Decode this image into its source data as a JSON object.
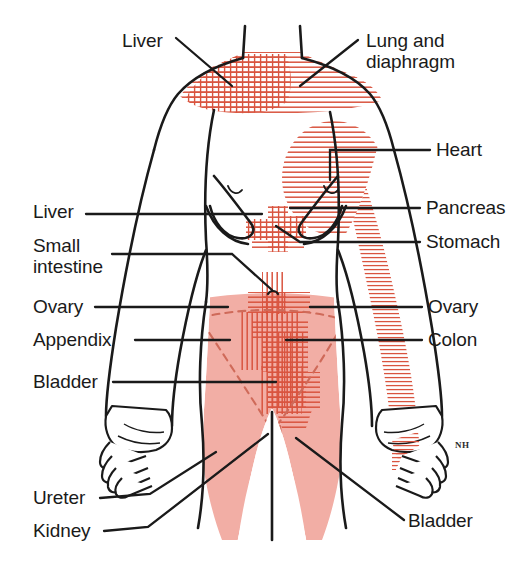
{
  "figure": {
    "signature": "NH",
    "colors": {
      "outline": "#1a1a1a",
      "pain_fill": "#f2aea5",
      "hatch": "#d9543f",
      "dashed": "#cf6a59",
      "label_text": "#1a1a1a",
      "background": "#ffffff"
    }
  },
  "labels": {
    "left": [
      {
        "id": "liver-top",
        "text": "Liver",
        "x": 122,
        "y": 30
      },
      {
        "id": "liver-mid",
        "text": "Liver",
        "x": 33,
        "y": 211
      },
      {
        "id": "small-intestine",
        "text": "Small\nintestine",
        "x": 33,
        "y": 245
      },
      {
        "id": "ovary-left",
        "text": "Ovary",
        "x": 33,
        "y": 303
      },
      {
        "id": "appendix",
        "text": "Appendix",
        "x": 33,
        "y": 335
      },
      {
        "id": "bladder-left",
        "text": "Bladder",
        "x": 33,
        "y": 378
      },
      {
        "id": "ureter",
        "text": "Ureter",
        "x": 33,
        "y": 494
      },
      {
        "id": "kidney",
        "text": "Kidney",
        "x": 33,
        "y": 527
      }
    ],
    "right": [
      {
        "id": "lung-diaphragm",
        "text": "Lung and\ndiaphragm",
        "x": 366,
        "y": 30
      },
      {
        "id": "heart",
        "text": "Heart",
        "x": 436,
        "y": 140
      },
      {
        "id": "pancreas",
        "text": "Pancreas",
        "x": 426,
        "y": 202
      },
      {
        "id": "stomach",
        "text": "Stomach",
        "x": 426,
        "y": 234
      },
      {
        "id": "ovary-right",
        "text": "Ovary",
        "x": 428,
        "y": 303
      },
      {
        "id": "colon",
        "text": "Colon",
        "x": 428,
        "y": 335
      },
      {
        "id": "bladder-right",
        "text": "Bladder",
        "x": 408,
        "y": 517
      }
    ]
  },
  "pain_regions": [
    {
      "id": "shoulder-neck-liver",
      "organ": "Liver",
      "pattern": "cross-hatch",
      "area": "right shoulder and base of neck"
    },
    {
      "id": "shoulder-lung",
      "organ": "Lung and diaphragm",
      "pattern": "horizontal-hatch",
      "area": "neck and left shoulder band"
    },
    {
      "id": "chest-heart",
      "organ": "Heart",
      "pattern": "horizontal-hatch",
      "area": "left chest over breast"
    },
    {
      "id": "left-arm-heart",
      "organ": "Heart",
      "pattern": "horizontal-hatch",
      "area": "inner left arm to hand"
    },
    {
      "id": "epigastric",
      "organ": "Pancreas / Stomach",
      "pattern": "cross-hatch",
      "area": "epigastrium"
    },
    {
      "id": "periumbilical",
      "organ": "Small intestine",
      "pattern": "cross-hatch",
      "area": "periumbilical"
    },
    {
      "id": "lower-abdomen",
      "organ": "Colon / Ovary / Appendix / Bladder",
      "pattern": "solid-fill",
      "area": "lower abdomen, groin and inner thighs"
    },
    {
      "id": "suprapubic",
      "organ": "Bladder",
      "pattern": "cross-hatch",
      "area": "suprapubic midline"
    }
  ]
}
